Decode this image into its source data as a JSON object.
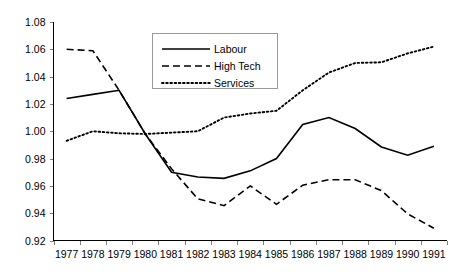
{
  "chart_data": {
    "type": "line",
    "title": "",
    "xlabel": "",
    "ylabel": "",
    "categories": [
      "1977",
      "1978",
      "1979",
      "1980",
      "1981",
      "1982",
      "1983",
      "1984",
      "1985",
      "1986",
      "1987",
      "1988",
      "1989",
      "1990",
      "1991"
    ],
    "ylim": [
      0.92,
      1.08
    ],
    "ytick_labels": [
      "1.08",
      "1.06",
      "1.04",
      "1.02",
      "1.00",
      "0.98",
      "0.96",
      "0.94",
      "0.92"
    ],
    "yticks": [
      1.08,
      1.06,
      1.04,
      1.02,
      1.0,
      0.98,
      0.96,
      0.94,
      0.92
    ],
    "grid": false,
    "legend_position": "top-center",
    "series": [
      {
        "name": "Labour",
        "style": "solid",
        "color": "#000000",
        "values": [
          1.024,
          1.027,
          1.03,
          0.998,
          0.97,
          0.9665,
          0.9655,
          0.971,
          0.98,
          1.005,
          1.01,
          1.002,
          0.9885,
          0.9825,
          0.989
        ]
      },
      {
        "name": "High Tech",
        "style": "dashed",
        "color": "#000000",
        "values": [
          1.06,
          1.059,
          1.03,
          0.998,
          0.9725,
          0.9505,
          0.9455,
          0.96,
          0.9465,
          0.9605,
          0.9645,
          0.9645,
          0.9565,
          0.9395,
          0.929
        ]
      },
      {
        "name": "Services",
        "style": "dotted",
        "color": "#000000",
        "values": [
          0.993,
          1.0,
          0.9985,
          0.998,
          0.999,
          1.0,
          1.01,
          1.013,
          1.015,
          1.03,
          1.043,
          1.05,
          1.0505,
          1.057,
          1.062
        ]
      }
    ]
  },
  "legend": {
    "items": [
      {
        "label": "Labour",
        "style": "solid"
      },
      {
        "label": "High Tech",
        "style": "dashed"
      },
      {
        "label": "Services",
        "style": "dotted"
      }
    ]
  }
}
